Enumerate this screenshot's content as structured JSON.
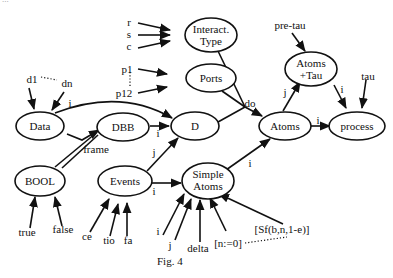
{
  "top_text": "...",
  "figure": {
    "caption": "Fig. 4",
    "nodes": {
      "interact_type": [
        "Interact.",
        "Type"
      ],
      "ports": "Ports",
      "d": "D",
      "data": "Data",
      "dbb": "DBB",
      "bool": "BOOL",
      "events": "Events",
      "simple_atoms": [
        "Simple",
        "Atoms"
      ],
      "atoms": "Atoms",
      "atoms_tau": [
        "Atoms",
        "+Tau"
      ],
      "process": "process"
    },
    "inputs": {
      "r": "r",
      "s": "s",
      "c": "c",
      "p1": "p1",
      "p12": "p12",
      "d1": "d1",
      "dn": "dn",
      "true": "true",
      "false": "false",
      "ce": "ce",
      "tio": "tio",
      "fa": "fa",
      "i": "i",
      "j": "j",
      "delta": "delta",
      "n_assign": "[n:=0]",
      "sf": "[Sf(b,n,1-e)]",
      "pre_tau": "pre-tau",
      "tau": "tau"
    },
    "edge_labels": {
      "data_to_d": "i",
      "dbb_to_d": "i",
      "frame": "frame",
      "events_to_d": "j",
      "events_to_simple": "i",
      "simple_to_atoms": "i",
      "do": "do",
      "atoms_to_atomstau": "j",
      "atoms_to_process": "i",
      "atomstau_to_process": "i"
    }
  }
}
